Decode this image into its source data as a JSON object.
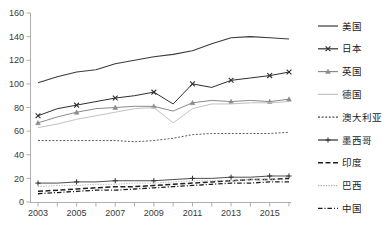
{
  "chart_data": {
    "type": "line",
    "title": "",
    "subtitle": "",
    "xlabel": "",
    "ylabel": "",
    "xlim": [
      2003,
      2016
    ],
    "ylim": [
      0,
      160
    ],
    "grid": false,
    "legend_position": "right",
    "x": [
      2003,
      2004,
      2005,
      2006,
      2007,
      2008,
      2009,
      2010,
      2011,
      2012,
      2013,
      2014,
      2015,
      2016
    ],
    "x_tick_labels": [
      "2003",
      "2005",
      "2007",
      "2009",
      "2011",
      "2013",
      "2015"
    ],
    "x_tick_values": [
      2003,
      2005,
      2007,
      2009,
      2011,
      2013,
      2015
    ],
    "y_tick_labels": [
      "0",
      "20",
      "40",
      "60",
      "80",
      "100",
      "120",
      "140",
      "160"
    ],
    "y_tick_values": [
      0,
      20,
      40,
      60,
      80,
      100,
      120,
      140,
      160
    ],
    "series": [
      {
        "name": "美国",
        "color": "#3b3b3b",
        "width": 1.1,
        "dash": "none",
        "marker": "none",
        "values": [
          101,
          106,
          110,
          112,
          117,
          120,
          123,
          125,
          128,
          134,
          139,
          140,
          139,
          138
        ]
      },
      {
        "name": "日本",
        "color": "#2e2e2e",
        "width": 1.0,
        "dash": "none",
        "marker": "x",
        "values": [
          73,
          79,
          82,
          85,
          88,
          90,
          93,
          83,
          100,
          97,
          103,
          105,
          107,
          110
        ]
      },
      {
        "name": "英国",
        "color": "#8a8a8a",
        "width": 1.0,
        "dash": "none",
        "marker": "triangle",
        "values": [
          67,
          72,
          76,
          79,
          80,
          81,
          81,
          77,
          84,
          86,
          85,
          86,
          85,
          87
        ]
      },
      {
        "name": "德国",
        "color": "#c2c2c2",
        "width": 1.0,
        "dash": "none",
        "marker": "none",
        "values": [
          63,
          66,
          70,
          73,
          76,
          79,
          80,
          67,
          79,
          83,
          83,
          84,
          84,
          85
        ]
      },
      {
        "name": "澳大利亚",
        "color": "#4a4a4a",
        "width": 0.9,
        "dash": "2,1.6",
        "marker": "none",
        "values": [
          52,
          52,
          52,
          52,
          52,
          51,
          52,
          54,
          57,
          58,
          58,
          58,
          58,
          59
        ]
      },
      {
        "name": "墨西哥",
        "color": "#2e2e2e",
        "width": 0.85,
        "dash": "none",
        "marker": "plus",
        "values": [
          16,
          16,
          17,
          17,
          18,
          18,
          18,
          19,
          20,
          20,
          21,
          21,
          22,
          22
        ]
      },
      {
        "name": "印度",
        "color": "#202020",
        "width": 1.5,
        "dash": "5,2.5",
        "marker": "none",
        "values": [
          9,
          10,
          11,
          12,
          13,
          13,
          14,
          15,
          16,
          17,
          18,
          19,
          19,
          20
        ]
      },
      {
        "name": "巴西",
        "color": "#b0b0b0",
        "width": 0.9,
        "dash": "1.3,1.3",
        "marker": "none",
        "values": [
          13,
          14,
          14,
          15,
          15,
          16,
          16,
          17,
          18,
          18,
          18,
          19,
          19,
          19
        ]
      },
      {
        "name": "中国",
        "color": "#1c1c1c",
        "width": 1.3,
        "dash": "4.5,2,1,2",
        "marker": "none",
        "values": [
          7,
          8,
          9,
          10,
          10,
          11,
          12,
          13,
          14,
          15,
          16,
          16,
          17,
          17
        ]
      }
    ]
  },
  "legend": {
    "items": [
      {
        "label": "美国"
      },
      {
        "label": "日本"
      },
      {
        "label": "英国"
      },
      {
        "label": "德国"
      },
      {
        "label": "澳大利亚"
      },
      {
        "label": "墨西哥"
      },
      {
        "label": "印度"
      },
      {
        "label": "巴西"
      },
      {
        "label": "中国"
      }
    ]
  }
}
